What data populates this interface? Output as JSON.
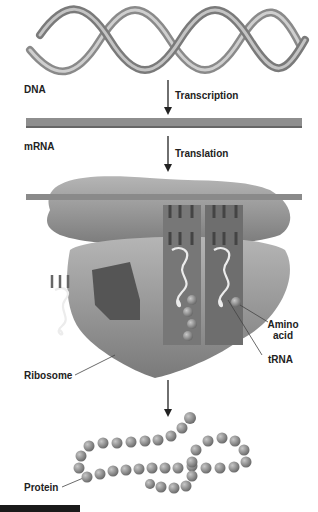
{
  "labels": {
    "dna": "DNA",
    "transcription": "Transcription",
    "mrna": "mRNA",
    "translation": "Translation",
    "amino_line1": "Amino",
    "amino_line2": "acid",
    "trna": "tRNA",
    "ribosome": "Ribosome",
    "protein": "Protein"
  },
  "colors": {
    "helix": "#9a9a9a",
    "mrna_band": "#8e8e8e",
    "ribosome": "#8a8a8a",
    "ribosome_light": "#a8a8a8",
    "bead": "#7d7d7d",
    "trna_loop": "#e8e8e8",
    "arrow": "#222222",
    "footer_bar": "#1a1a1a"
  }
}
